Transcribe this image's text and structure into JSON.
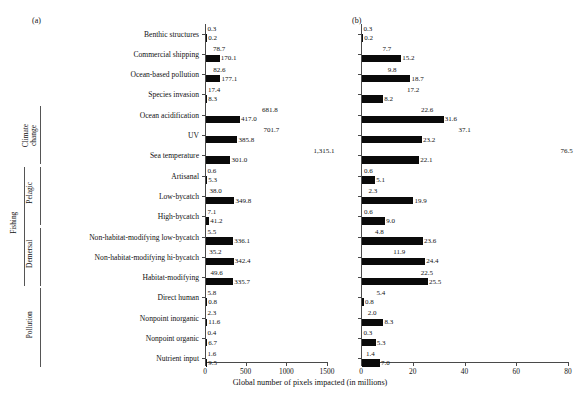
{
  "figure": {
    "panel_a_tag": "(a)",
    "panel_b_tag": "(b)",
    "xlabel": "Global number of pixels impacted (in millions)"
  },
  "groups": [
    {
      "name": "Climate change",
      "label_lines": [
        "Climate",
        "change"
      ]
    },
    {
      "name": "Fishing",
      "label_lines": [
        "Fishing"
      ]
    },
    {
      "name": "Pelagic",
      "label_lines": [
        "Pelagic"
      ]
    },
    {
      "name": "Demersal",
      "label_lines": [
        "Demersal"
      ]
    },
    {
      "name": "Pollution",
      "label_lines": [
        "Pollution"
      ]
    }
  ],
  "categories": [
    "Benthic structures",
    "Commercial shipping",
    "Ocean-based pollution",
    "Species invasion",
    "Ocean acidification",
    "UV",
    "Sea temperature",
    "Artisanal",
    "Low-bycatch",
    "High-bycatch",
    "Non-habitat-modifying low-bycatch",
    "Non-habitat-modifying hi-bycatch",
    "Habitat-modifying",
    "Direct human",
    "Nonpoint inorganic",
    "Nonpoint organic",
    "Nutrient input"
  ],
  "chart_data": {
    "type": "bar",
    "title": "",
    "xlabel": "Global number of pixels impacted (in millions)",
    "ylabel": "",
    "grid": false,
    "legend": "none",
    "orientation": "horizontal",
    "panels": [
      {
        "tag": "(a)",
        "xlim": [
          0,
          1500
        ],
        "xticks": [
          0,
          500,
          1000,
          1500
        ],
        "xticklabels": [
          "0",
          "500",
          "1000",
          "1500"
        ],
        "series": [
          {
            "name": "upper",
            "values": [
              0.3,
              78.7,
              82.6,
              17.4,
              681.8,
              701.7,
              1315.1,
              0.6,
              38.0,
              7.1,
              5.5,
              35.2,
              49.6,
              5.8,
              2.3,
              0.4,
              1.6
            ],
            "labels": [
              "0.3",
              "78.7",
              "82.6",
              "17.4",
              "681.8",
              "701.7",
              "1,315.1",
              "0.6",
              "38.0",
              "7.1",
              "5.5",
              "35.2",
              "49.6",
              "5.8",
              "2.3",
              "0.4",
              "1.6"
            ]
          },
          {
            "name": "lower",
            "values": [
              0.2,
              170.1,
              177.1,
              8.3,
              417.0,
              385.8,
              301.0,
              5.3,
              349.8,
              41.2,
              336.1,
              342.4,
              335.7,
              0.8,
              11.6,
              6.7,
              9.5
            ],
            "labels": [
              "0.2",
              "170.1",
              "177.1",
              "8.3",
              "417.0",
              "385.8",
              "301.0",
              "5.3",
              "349.8",
              "41.2",
              "336.1",
              "342.4",
              "335.7",
              "0.8",
              "11.6",
              "6.7",
              "9.5"
            ]
          }
        ]
      },
      {
        "tag": "(b)",
        "xlim": [
          0,
          80
        ],
        "xticks": [
          0,
          20,
          40,
          60,
          80
        ],
        "xticklabels": [
          "0",
          "20",
          "40",
          "60",
          "80"
        ],
        "series": [
          {
            "name": "upper",
            "values": [
              0.3,
              7.7,
              9.8,
              17.2,
              22.6,
              37.1,
              76.5,
              0.6,
              2.3,
              0.6,
              4.8,
              11.9,
              22.5,
              5.4,
              2.0,
              0.3,
              1.4
            ],
            "labels": [
              "0.3",
              "7.7",
              "9.8",
              "17.2",
              "22.6",
              "37.1",
              "76.5",
              "0.6",
              "2.3",
              "0.6",
              "4.8",
              "11.9",
              "22.5",
              "5.4",
              "2.0",
              "0.3",
              "1.4"
            ]
          },
          {
            "name": "lower",
            "values": [
              0.2,
              15.2,
              18.7,
              8.2,
              31.6,
              23.2,
              22.1,
              5.1,
              19.9,
              9.0,
              23.6,
              24.4,
              25.5,
              0.8,
              8.3,
              5.3,
              7.0
            ],
            "labels": [
              "0.2",
              "15.2",
              "18.7",
              "8.2",
              "31.6",
              "23.2",
              "22.1",
              "5.1",
              "19.9",
              "9.0",
              "23.6",
              "24.4",
              "25.5",
              "0.8",
              "8.3",
              "5.3",
              "7.0"
            ]
          }
        ]
      }
    ]
  }
}
